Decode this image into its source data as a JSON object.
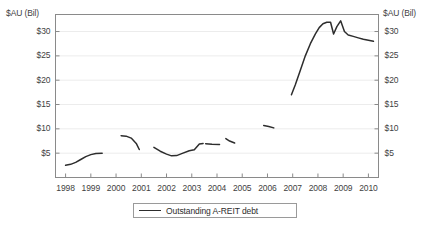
{
  "chart_data": {
    "type": "line",
    "title": "",
    "xlabel": "",
    "ylabel": "$AU (Bil)",
    "ylabel_right": "$AU (Bil)",
    "xlim": [
      1997.6,
      2010.4
    ],
    "ylim": [
      0,
      33.5
    ],
    "grid": true,
    "grid_axis": "y",
    "legend_position": "bottom-center",
    "line_color": "#2d2d2d",
    "frame_color": "#8a8a8a",
    "grid_color": "#ececec",
    "background": "#ffffff",
    "xticks": [
      1998,
      1999,
      2000,
      2001,
      2002,
      2003,
      2004,
      2005,
      2006,
      2007,
      2008,
      2009,
      2010
    ],
    "xtick_labels": [
      "1998",
      "1999",
      "2000",
      "2001",
      "2002",
      "2003",
      "2004",
      "2005",
      "2006",
      "2007",
      "2008",
      "2009",
      "2010"
    ],
    "yticks": [
      5,
      10,
      15,
      20,
      25,
      30
    ],
    "ytick_labels": [
      "$5",
      "$10",
      "$15",
      "$20",
      "$25",
      "$30"
    ],
    "ytick_labels_right": [
      "$5",
      "$10",
      "$15",
      "$20",
      "$25",
      "$30"
    ],
    "series": [
      {
        "name": "Outstanding A-REIT debt",
        "note": "Broken line — data plotted in discontinuous segments with gaps between observation runs",
        "segments": [
          {
            "label": "1998-1999",
            "x": [
              1998.0,
              1998.2,
              1998.4,
              1998.6,
              1998.8,
              1999.0,
              1999.2,
              1999.45
            ],
            "y": [
              2.5,
              2.7,
              3.1,
              3.7,
              4.3,
              4.7,
              4.95,
              5.0
            ]
          },
          {
            "label": "2000",
            "x": [
              2000.2,
              2000.4,
              2000.6,
              2000.8,
              2000.92
            ],
            "y": [
              8.6,
              8.5,
              8.1,
              7.0,
              5.75
            ]
          },
          {
            "label": "2001-2003",
            "x": [
              2001.5,
              2001.75,
              2002.0,
              2002.2,
              2002.4,
              2002.6,
              2002.9,
              2003.1,
              2003.3,
              2003.45
            ],
            "y": [
              6.2,
              5.4,
              4.8,
              4.45,
              4.5,
              4.9,
              5.5,
              5.7,
              6.9,
              7.0
            ]
          },
          {
            "label": "2003-2004",
            "x": [
              2003.55,
              2003.8,
              2004.1
            ],
            "y": [
              6.95,
              6.85,
              6.8
            ]
          },
          {
            "label": "2004",
            "x": [
              2004.35,
              2004.5,
              2004.7
            ],
            "y": [
              8.0,
              7.5,
              7.1
            ]
          },
          {
            "label": "2006",
            "x": [
              2005.85,
              2006.05,
              2006.25
            ],
            "y": [
              10.7,
              10.5,
              10.2
            ]
          },
          {
            "label": "2007-2010",
            "x": [
              2006.95,
              2007.1,
              2007.3,
              2007.5,
              2007.7,
              2007.9,
              2008.05,
              2008.2,
              2008.35,
              2008.5,
              2008.62,
              2008.75,
              2008.9,
              2009.05,
              2009.2,
              2009.4,
              2009.6,
              2009.8,
              2010.0,
              2010.2
            ],
            "y": [
              17.0,
              19.0,
              22.0,
              25.0,
              27.5,
              29.5,
              30.8,
              31.6,
              31.9,
              31.9,
              29.5,
              31.0,
              32.2,
              30.0,
              29.3,
              29.0,
              28.7,
              28.4,
              28.2,
              28.0
            ]
          }
        ]
      }
    ],
    "legend": [
      {
        "label": "Outstanding A-REIT debt",
        "color": "#2d2d2d"
      }
    ]
  }
}
